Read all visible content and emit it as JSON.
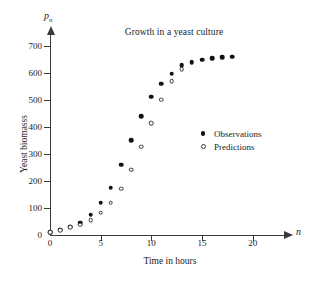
{
  "chart_data": {
    "type": "scatter",
    "title": "Growth in a yeast culture",
    "xlabel": "Time in hours",
    "ylabel": "Yeast biomasss",
    "x_axis_variable": "n",
    "y_axis_variable": "p",
    "y_axis_variable_subscript": "n",
    "xlim": [
      0,
      22.5
    ],
    "ylim": [
      0,
      730
    ],
    "xticks": [
      0,
      5,
      10,
      15,
      20
    ],
    "yticks": [
      0,
      100,
      200,
      300,
      400,
      500,
      600,
      700
    ],
    "grid": false,
    "legend_position": "center-right",
    "x": [
      0,
      1,
      2,
      3,
      4,
      5,
      6,
      7,
      8,
      9,
      10,
      11,
      12,
      13,
      14,
      15,
      16,
      17,
      18
    ],
    "series": [
      {
        "name": "Observations",
        "marker": "filled-circle",
        "color": "#111111",
        "x": [
          0,
          1,
          2,
          3,
          4,
          5,
          6,
          7,
          8,
          9,
          10,
          11,
          12,
          13,
          14,
          15,
          16,
          17,
          18
        ],
        "values": [
          10,
          20,
          30,
          45,
          75,
          120,
          175,
          260,
          352,
          440,
          513,
          560,
          597,
          630,
          640,
          650,
          655,
          658,
          660
        ]
      },
      {
        "name": "Predictions",
        "marker": "open-circle",
        "color": "#333333",
        "x": [
          0,
          1,
          2,
          3,
          4,
          5,
          6,
          7,
          8,
          9,
          10,
          11,
          12,
          13
        ],
        "values": [
          10,
          18,
          28,
          38,
          55,
          82,
          120,
          172,
          242,
          327,
          414,
          502,
          570,
          615
        ]
      }
    ]
  },
  "legend": {
    "entries": [
      {
        "label": "Observations",
        "marker": "filled-circle"
      },
      {
        "label": "Predictions",
        "marker": "open-circle"
      }
    ]
  }
}
